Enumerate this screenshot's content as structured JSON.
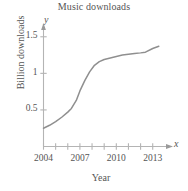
{
  "chart_data": {
    "type": "line",
    "title": "Music downloads",
    "xlabel": "Year",
    "ylabel": "Billion downloads",
    "x_axis_symbol": "x",
    "y_axis_symbol": "y",
    "xlim": [
      2004,
      2013.6
    ],
    "ylim": [
      0,
      1.62
    ],
    "grid": false,
    "legend": null,
    "xtick_labels": [
      "2004",
      "2007",
      "2010",
      "2013"
    ],
    "xtick_values": [
      2004,
      2007,
      2010,
      2013
    ],
    "xtick_marks": [
      2004,
      2005,
      2006,
      2007,
      2008,
      2009,
      2010,
      2011,
      2012,
      2013
    ],
    "ytick_labels": [
      "0.5",
      "1",
      "1.5"
    ],
    "ytick_values": [
      0.5,
      1,
      1.5
    ],
    "series": [
      {
        "name": "Music downloads",
        "color": "#8f8f8f",
        "x": [
          2004,
          2004.5,
          2005,
          2005.5,
          2006,
          2006.3,
          2006.7,
          2007,
          2007.4,
          2007.8,
          2008.2,
          2008.6,
          2009,
          2009.5,
          2010,
          2010.5,
          2011,
          2011.5,
          2012,
          2012.4,
          2013,
          2013.5
        ],
        "y": [
          0.25,
          0.29,
          0.34,
          0.4,
          0.47,
          0.52,
          0.63,
          0.76,
          0.9,
          1.02,
          1.11,
          1.16,
          1.19,
          1.21,
          1.23,
          1.25,
          1.26,
          1.27,
          1.28,
          1.29,
          1.34,
          1.37
        ]
      }
    ]
  },
  "axes": {
    "y_label_color": "#555555",
    "axis_color": "#b4b4b4"
  }
}
